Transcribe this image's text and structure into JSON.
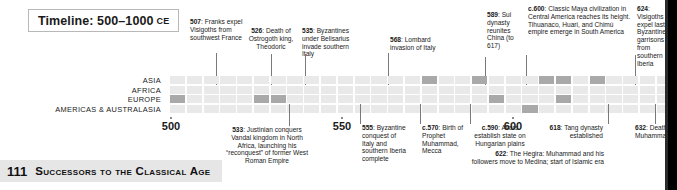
{
  "header": {
    "title": "Timeline: 500–1000",
    "era": "CE"
  },
  "regions": [
    {
      "label": "ASIA"
    },
    {
      "label": "AFRICA"
    },
    {
      "label": "EUROPE"
    },
    {
      "label": "AMERICAS & AUSTRALASIA"
    }
  ],
  "axis": {
    "ticks": [
      "500",
      "550",
      "600",
      "632"
    ],
    "start_year": 500,
    "decade_count": 30
  },
  "annotations_above": [
    {
      "year": "507",
      "text": "Franks expel Visigoths from southwest France",
      "full": "507: Franks expel Visigoths from southwest France"
    },
    {
      "year": "526",
      "text": "Death of Ostrogoth king, Theodoric",
      "full": "526: Death of Ostrogoth king, Theodoric"
    },
    {
      "year": "535",
      "text": "Byzantines under Belisarius invade southern Italy",
      "full": "535: Byzantines under Belisarius invade southern Italy"
    },
    {
      "year": "568",
      "text": "Lombard invasion of Italy",
      "full": "568: Lombard invasion of Italy"
    },
    {
      "year": "589",
      "text": "Sui dynasty reunites China (to 617)",
      "full": "589: Sui dynasty reunites China (to 617)"
    },
    {
      "year": "c.600",
      "text": "Classic Maya civilization in Central America reaches its height. Tihuanaco, Huari, and Chimú empire emerge in South America",
      "full": "c.600: Classic Maya civilization in Central America reaches its height. Tihuanaco, Huari, and Chimú empire emerge in South America"
    },
    {
      "year": "624",
      "text": "Visigoths expel last Byzantine garrisons from southern Iberia",
      "full": "624: Visigoths expel last Byzantine garrisons from southern Iberia"
    }
  ],
  "annotations_below": [
    {
      "year": "533",
      "text": "Justinian conquers Vandal kingdom in North Africa, launching his “reconquest” of former West Roman Empire",
      "full": "533: Justinian conquers Vandal kingdom in North Africa, launching his “reconquest” of former West Roman Empire"
    },
    {
      "year": "555",
      "text": "Byzantine conquest of Italy and southern Iberia complete",
      "full": "555: Byzantine conquest of Italy and southern Iberia complete"
    },
    {
      "year": "c.570",
      "text": "Birth of Prophet Muhammad, Mecca",
      "full": "c.570: Birth of Prophet Muhammad, Mecca"
    },
    {
      "year": "c.590",
      "text": "Avars establish state on Hungarian plains",
      "full": "c.590: Avars establish state on Hungarian plains"
    },
    {
      "year": "618",
      "text": "Tang dynasty established",
      "full": "618: Tang dynasty established"
    },
    {
      "year": "622",
      "text": "The Hegira: Muhammad and his followers move to Medina; start of Islamic era",
      "full": "622: The Hegira: Muhammad and his followers move to Medina; start of Islamic era"
    },
    {
      "year": "632",
      "text": "Death of Muhammad",
      "full": "632: Death of Muhammad"
    }
  ],
  "chart_data": {
    "type": "heatmap",
    "title": "Timeline: 500–1000 CE",
    "xlabel": "",
    "ylabel": "",
    "categories": [
      "500",
      "510",
      "520",
      "530",
      "540",
      "550",
      "560",
      "570",
      "580",
      "590",
      "600",
      "610",
      "620",
      "630",
      "640",
      "650",
      "660",
      "670",
      "680",
      "690",
      "700",
      "710",
      "720",
      "730",
      "740",
      "750",
      "760",
      "770",
      "780",
      "790"
    ],
    "rows": [
      "ASIA",
      "AFRICA",
      "EUROPE",
      "AMERICAS & AUSTRALASIA"
    ],
    "series": [
      {
        "name": "ASIA",
        "values": [
          0,
          0,
          0,
          0,
          0,
          0,
          0,
          0,
          0,
          0,
          0,
          0,
          0,
          0,
          0,
          1,
          0,
          0,
          1,
          0,
          0,
          0,
          1,
          1,
          0,
          1,
          0,
          0,
          0,
          0
        ]
      },
      {
        "name": "AFRICA",
        "values": [
          0,
          0,
          0,
          0,
          0,
          0,
          0,
          0,
          0,
          0,
          0,
          0,
          0,
          0,
          0,
          0,
          0,
          0,
          0,
          0,
          0,
          0,
          0,
          0,
          0,
          0,
          0,
          0,
          0,
          0
        ]
      },
      {
        "name": "EUROPE",
        "values": [
          1,
          0,
          0,
          0,
          0,
          1,
          1,
          0,
          0,
          0,
          0,
          0,
          0,
          0,
          0,
          0,
          0,
          0,
          0,
          1,
          0,
          0,
          0,
          1,
          0,
          0,
          0,
          0,
          0,
          0
        ]
      },
      {
        "name": "AMERICAS & AUSTRALASIA",
        "values": [
          0,
          0,
          0,
          0,
          0,
          0,
          0,
          0,
          0,
          0,
          0,
          0,
          0,
          0,
          0,
          0,
          0,
          0,
          0,
          0,
          0,
          1,
          0,
          0,
          0,
          0,
          0,
          0,
          0,
          0
        ]
      }
    ],
    "grid": true,
    "legend": "none",
    "colors": {
      "off": "#e9e9e9",
      "on": "#a9a9a9"
    }
  },
  "footer": {
    "page_number": "111",
    "section_title": "Successors to the Classical Age"
  }
}
